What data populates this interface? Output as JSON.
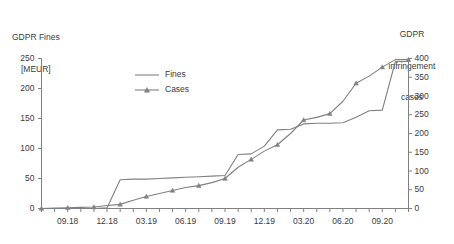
{
  "chart_data": {
    "type": "line",
    "title": "",
    "xlabel": "",
    "ylabel": "GDPR Fines [MEUR]",
    "y2label": "GDPR infringement cases",
    "ylim": [
      0,
      250
    ],
    "y2lim": [
      0,
      400
    ],
    "grid": false,
    "legend_position": "top-center",
    "left_axis_title_lines": [
      "GDPR Fines",
      "[MEUR]"
    ],
    "right_axis_title_lines": [
      "GDPR",
      "infringement",
      "cases"
    ],
    "y_ticks_left": [
      "0",
      "50",
      "100",
      "150",
      "200",
      "250"
    ],
    "y_ticks_right": [
      "0",
      "50",
      "100",
      "150",
      "200",
      "250",
      "300",
      "350",
      "400"
    ],
    "x_tick_labels": [
      "09.18",
      "12.18",
      "03.19",
      "06.19",
      "09.19",
      "12.19",
      "03.20",
      "06.20",
      "09.20"
    ],
    "x_months": [
      "07.18",
      "08.18",
      "09.18",
      "10.18",
      "11.18",
      "12.18",
      "01.19",
      "02.19",
      "03.19",
      "04.19",
      "05.19",
      "06.19",
      "07.19",
      "08.19",
      "09.19",
      "10.19",
      "11.19",
      "12.19",
      "01.20",
      "02.20",
      "03.20",
      "04.20",
      "05.20",
      "06.20",
      "07.20",
      "08.20",
      "09.20",
      "10.20",
      "11.20"
    ],
    "series": [
      {
        "name": "Fines",
        "axis": "left",
        "marker": "none",
        "color": "#808080",
        "values": [
          0,
          0,
          0,
          0,
          0,
          1,
          48,
          49,
          49,
          50,
          51,
          52,
          53,
          54,
          55,
          90,
          91,
          104,
          131,
          132,
          141,
          142,
          142,
          143,
          152,
          163,
          164,
          245,
          245
        ]
      },
      {
        "name": "Cases",
        "axis": "right",
        "marker": "triangle",
        "color": "#808080",
        "values": [
          0,
          1,
          2,
          3,
          4,
          8,
          11,
          22,
          32,
          40,
          48,
          56,
          61,
          69,
          80,
          110,
          131,
          153,
          170,
          200,
          236,
          243,
          253,
          286,
          334,
          353,
          377,
          397,
          397
        ]
      }
    ],
    "legend": [
      {
        "label": "Fines",
        "marker": "none"
      },
      {
        "label": "Cases",
        "marker": "triangle"
      }
    ],
    "colors": {
      "line": "#808080",
      "axis": "#808080",
      "text": "#3b3b3b"
    }
  }
}
